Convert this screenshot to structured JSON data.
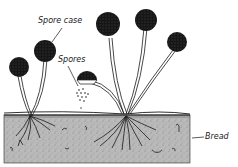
{
  "diagram": {
    "labels": {
      "spore_case": "Spore case",
      "spores": "Spores",
      "bread": "Bread"
    },
    "colors": {
      "ink": "#1a1a1a",
      "bread_fill": "#b8b8b8",
      "background": "#ffffff"
    }
  }
}
